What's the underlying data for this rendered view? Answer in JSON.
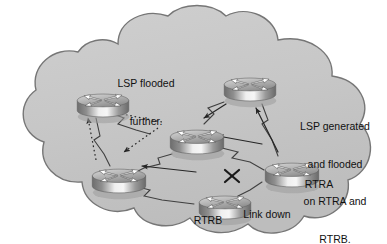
{
  "figure": {
    "type": "network-diagram",
    "colors": {
      "page_background": "#ffffff",
      "cloud_fill": "#c6c6c6",
      "cloud_fill_light": "#d2d2d2",
      "cloud_outline": "#6f6f6f",
      "link_line": "#3c3c3c",
      "arrow_solid": "#2b2b2b",
      "arrow_dotted": "#2b2b2b",
      "router_body_dark": "#6e6e6e",
      "router_body_light": "#f2f2f2",
      "router_top": "#b8b8b8",
      "text": "#111111",
      "x_mark": "#1a1a1a"
    }
  },
  "cloud": {
    "name": "network-cloud",
    "description": "Large gray cloud shape enclosing the routers"
  },
  "annotations": [
    {
      "id": "lsp-flooded-further",
      "lines": [
        "LSP flooded",
        "further."
      ],
      "x": 96,
      "y": 52,
      "width": 100
    },
    {
      "id": "lsp-generated-flooded",
      "lines": [
        "LSP generated",
        "and flooded",
        "on RTRA and",
        "RTRB."
      ],
      "x": 283,
      "y": 95,
      "width": 104
    },
    {
      "id": "link-down",
      "lines": [
        "Link down"
      ],
      "x": 228,
      "y": 183,
      "width": 78
    }
  ],
  "routers": [
    {
      "id": "router-top-left",
      "label": "",
      "x": 75,
      "y": 88,
      "w": 56,
      "h": 34
    },
    {
      "id": "router-top-right",
      "label": "",
      "x": 222,
      "y": 72,
      "w": 56,
      "h": 34
    },
    {
      "id": "router-center",
      "label": "",
      "x": 168,
      "y": 124,
      "w": 58,
      "h": 35
    },
    {
      "id": "router-bottom-left",
      "label": "",
      "x": 90,
      "y": 163,
      "w": 58,
      "h": 35
    },
    {
      "id": "router-rtra",
      "label": "RTRA",
      "x": 263,
      "y": 157,
      "w": 58,
      "h": 35
    },
    {
      "id": "router-rtrb",
      "label": "RTRB",
      "x": 197,
      "y": 190,
      "w": 56,
      "h": 34
    }
  ],
  "router_labels": [
    {
      "id": "rtra-label",
      "text": "RTRA",
      "x": 289,
      "y": 178,
      "width": 60
    },
    {
      "id": "rtrb-label",
      "text": "RTRB",
      "x": 178,
      "y": 214,
      "width": 60
    }
  ],
  "links": {
    "name": "router-links",
    "down_link": {
      "id": "link-rtrb-rtra",
      "status": "down",
      "marker": "x-mark",
      "x": 231,
      "y": 176
    }
  },
  "legend": {
    "solid_arrow_meaning": "LSP generated and flooded on RTRA and RTRB",
    "dotted_arrow_meaning": "LSP flooded further"
  }
}
